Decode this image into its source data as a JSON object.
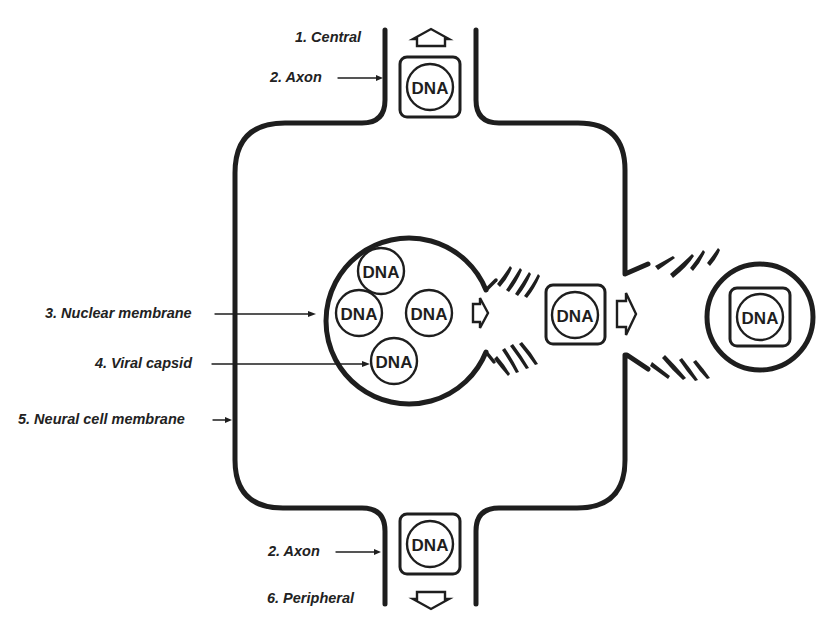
{
  "diagram": {
    "type": "viral transport through neuron",
    "labels": {
      "central": "1. Central",
      "axon_top": "2. Axon",
      "nuclear_membrane": "3. Nuclear membrane",
      "viral_capsid": "4. Viral capsid",
      "neural_cell_membrane": "5. Neural cell membrane",
      "axon_bottom": "2. Axon",
      "peripheral": "6. Peripheral"
    },
    "dna_label": "DNA",
    "nucleus_dna": [
      "DNA",
      "DNA",
      "DNA",
      "DNA"
    ],
    "capsid_cytoplasm": "DNA",
    "capsid_axon_top": "DNA",
    "capsid_axon_bottom": "DNA",
    "capsid_extracellular": "DNA",
    "colors": {
      "line": "#1e1e1e",
      "background": "#ffffff"
    }
  }
}
